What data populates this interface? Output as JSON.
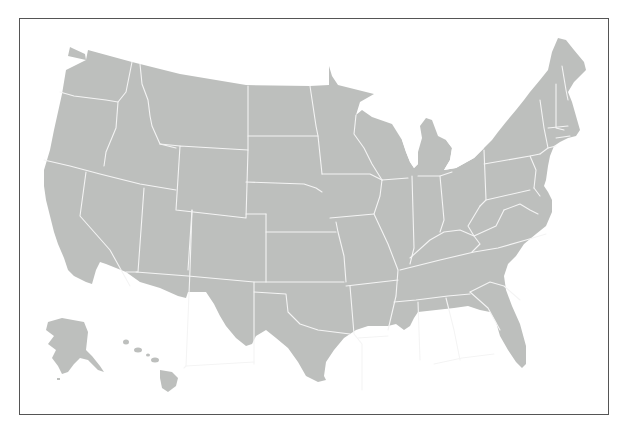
{
  "map": {
    "title": "United States blank state outline map",
    "subject": "United States of America — 50 states",
    "regions": [
      "Contiguous United States",
      "Alaska",
      "Hawaii"
    ],
    "style": {
      "land_color": "#bdbfbd",
      "border_color": "#f4f4f4",
      "frame_color": "#555555",
      "background": "#ffffff"
    },
    "labels_visible": false
  }
}
